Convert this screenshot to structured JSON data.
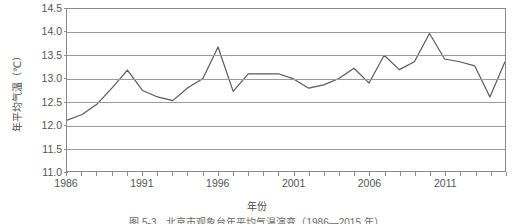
{
  "chart_data": {
    "type": "line",
    "title": "",
    "xlabel": "年份",
    "ylabel": "年平均气温（℃）",
    "ylim": [
      11.0,
      14.5
    ],
    "xlim": [
      1986,
      2015
    ],
    "grid": true,
    "legend": "none",
    "y_ticks": [
      "11.0",
      "11.5",
      "12.0",
      "12.5",
      "13.0",
      "13.5",
      "14.0",
      "14.5"
    ],
    "y_tick_values": [
      11.0,
      11.5,
      12.0,
      12.5,
      13.0,
      13.5,
      14.0,
      14.5
    ],
    "x_ticks": [
      "1986",
      "1991",
      "1996",
      "2001",
      "2006",
      "2011"
    ],
    "x_tick_values": [
      1986,
      1991,
      1996,
      2001,
      2006,
      2011
    ],
    "x": [
      1986,
      1987,
      1988,
      1989,
      1990,
      1991,
      1992,
      1993,
      1994,
      1995,
      1996,
      1997,
      1998,
      1999,
      2000,
      2001,
      2002,
      2003,
      2004,
      2005,
      2006,
      2007,
      2008,
      2009,
      2010,
      2011,
      2012,
      2013,
      2014,
      2015
    ],
    "series": [
      {
        "name": "年平均气温",
        "color": "#595959",
        "values": [
          12.1,
          12.22,
          12.45,
          12.8,
          13.18,
          12.74,
          12.6,
          12.52,
          12.8,
          13.0,
          13.68,
          12.72,
          13.1,
          13.1,
          13.1,
          12.99,
          12.79,
          12.86,
          13.0,
          13.22,
          12.9,
          13.5,
          13.19,
          13.36,
          13.97,
          13.42,
          13.36,
          13.27,
          12.6,
          13.36
        ]
      }
    ],
    "caption": "图 5-3　北京市观象台年平均气温演变（1986—2015 年）"
  },
  "colors": {
    "line": "#595959",
    "grid": "#9a9a9a",
    "frame": "#8a8a8a",
    "text": "#545454",
    "background": "#ffffff"
  }
}
